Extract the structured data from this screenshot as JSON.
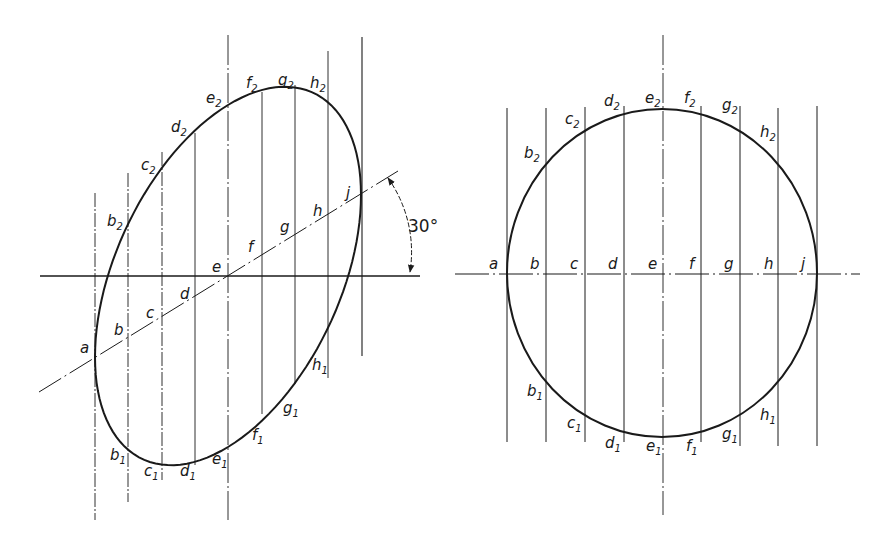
{
  "left_figure": {
    "description": "Ellipse: true shape of circle on plane inclined at 30°",
    "center": [
      228,
      276
    ],
    "axis_angle_deg": 30,
    "angle_label": "30°",
    "axis_points": [
      {
        "label": "a",
        "x": 95
      },
      {
        "label": "b",
        "x": 128
      },
      {
        "label": "c",
        "x": 162
      },
      {
        "label": "d",
        "x": 195
      },
      {
        "label": "e",
        "x": 228
      },
      {
        "label": "f",
        "x": 262
      },
      {
        "label": "g",
        "x": 295
      },
      {
        "label": "h",
        "x": 328
      },
      {
        "label": "j",
        "x": 361
      }
    ],
    "upper_labels": [
      "b₂",
      "c₂",
      "d₂",
      "e₂",
      "f₂",
      "g₂",
      "h₂"
    ],
    "lower_labels": [
      "b₁",
      "c₁",
      "d₁",
      "e₁",
      "f₁",
      "g₁",
      "h₁"
    ]
  },
  "right_figure": {
    "description": "Circle with projection lines",
    "center": [
      662,
      273
    ],
    "axis_points": [
      {
        "label": "a",
        "x": 507
      },
      {
        "label": "b",
        "x": 546
      },
      {
        "label": "c",
        "x": 585
      },
      {
        "label": "d",
        "x": 624
      },
      {
        "label": "e",
        "x": 662
      },
      {
        "label": "f",
        "x": 701
      },
      {
        "label": "g",
        "x": 740
      },
      {
        "label": "h",
        "x": 779
      },
      {
        "label": "j",
        "x": 818
      }
    ],
    "upper_labels": [
      "b₂",
      "c₂",
      "d₂",
      "e₂",
      "f₂",
      "g₂",
      "h₂"
    ],
    "lower_labels": [
      "b₁",
      "c₁",
      "d₁",
      "e₁",
      "f₁",
      "g₁",
      "h₁"
    ]
  },
  "labels": {
    "a": "a",
    "b": "b",
    "c": "c",
    "d": "d",
    "e": "e",
    "f": "f",
    "g": "g",
    "h": "h",
    "j": "j",
    "sub1": "1",
    "sub2": "2",
    "angle": "30°"
  }
}
